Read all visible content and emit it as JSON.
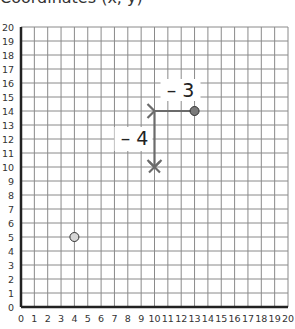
{
  "title": "Coordinates (x, y)",
  "chart_data": {
    "type": "scatter",
    "xlim": [
      0,
      20
    ],
    "ylim": [
      0,
      20
    ],
    "grid": true,
    "x_ticks": [
      "0",
      "1",
      "2",
      "3",
      "4",
      "5",
      "6",
      "7",
      "8",
      "9",
      "10",
      "11",
      "12",
      "13",
      "14",
      "15",
      "16",
      "17",
      "18",
      "19",
      "20"
    ],
    "y_ticks": [
      "0",
      "1",
      "2",
      "3",
      "4",
      "5",
      "6",
      "7",
      "8",
      "9",
      "10",
      "11",
      "12",
      "13",
      "14",
      "15",
      "16",
      "17",
      "18",
      "19",
      "20"
    ],
    "points": [
      {
        "name": "start-point",
        "x": 13,
        "y": 14,
        "style": "filled-dark"
      },
      {
        "name": "target-point",
        "x": 10,
        "y": 10,
        "style": "cross"
      },
      {
        "name": "other-point",
        "x": 4,
        "y": 5,
        "style": "filled-light"
      }
    ],
    "moves": [
      {
        "from": [
          13,
          14
        ],
        "to": [
          10,
          14
        ],
        "label": "– 3"
      },
      {
        "from": [
          10,
          14
        ],
        "to": [
          10,
          10
        ],
        "label": "– 4"
      }
    ]
  },
  "colors": {
    "grid": "#8a8a8a",
    "axis": "#222222",
    "arrow": "#6b6b6b",
    "start_point": "#7a7a7a",
    "other_point": "#d6d6d6"
  }
}
